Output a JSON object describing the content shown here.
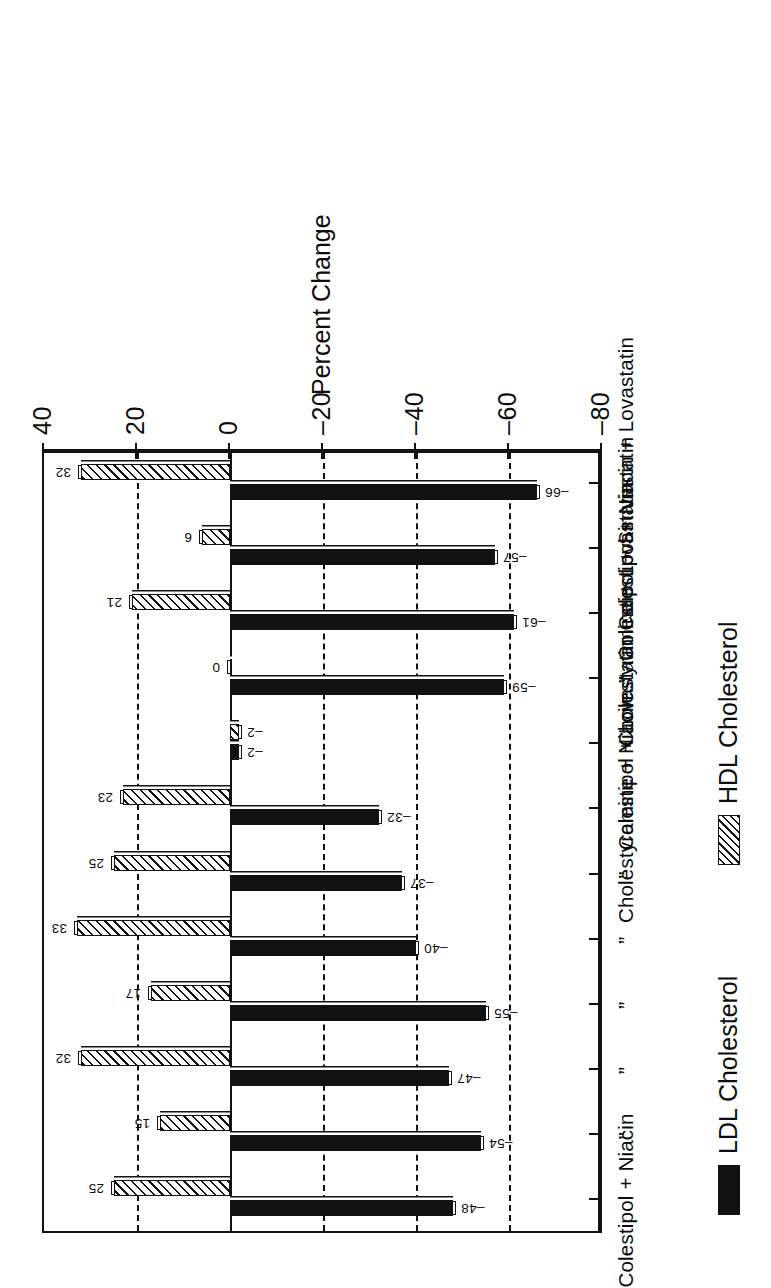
{
  "chart_data": {
    "type": "bar",
    "title": "",
    "orientation": "vertical-bars-on-rotated-page",
    "xlabel": "",
    "ylabel": "Percent Change",
    "ylim": [
      -80,
      40
    ],
    "ytick_values": [
      -80,
      -60,
      -40,
      -20,
      0,
      20,
      40
    ],
    "ytick_labels": [
      "–80",
      "–60",
      "–40",
      "–20",
      "0",
      "20",
      "40"
    ],
    "gridlines": {
      "enabled": true,
      "style": "dashed",
      "at": [
        20,
        -20,
        -40,
        -60
      ]
    },
    "zero_line": true,
    "legend_position": "below-plot",
    "categories": [
      "Colestipol + Niacin",
      "”",
      "”",
      "”",
      "”",
      "”",
      "Cholestyramine + Niacin",
      "Colestipol + Lovastatin",
      "”",
      "Cholestyramine + Lovastatin",
      "Colestipol + Simvastatin",
      "Colestipol + Niacin + Lovastatin"
    ],
    "series": [
      {
        "name": "LDL Cholesterol",
        "fill": "solid-black",
        "color": "#111111",
        "values": [
          -48,
          -54,
          -47,
          -55,
          -40,
          -37,
          -32,
          -2,
          -59,
          -61,
          -57,
          -66
        ],
        "labels": [
          "–48",
          "–54",
          "–47",
          "–55",
          "–40",
          "–37",
          "–32",
          "–2",
          "–59",
          "–61",
          "–57",
          "–66"
        ]
      },
      {
        "name": "HDL Cholesterol",
        "fill": "diagonal-hatch",
        "color": "#111111",
        "values": [
          25,
          15,
          32,
          17,
          33,
          25,
          23,
          -2,
          0,
          21,
          6,
          32
        ],
        "labels": [
          "25",
          "15",
          "32",
          "17",
          "33",
          "25",
          "23",
          "–2",
          "0",
          "21",
          "6",
          "32"
        ]
      }
    ]
  },
  "legend": {
    "items": [
      {
        "label": "LDL Cholesterol",
        "swatch": "solid-black-swatch"
      },
      {
        "label": "HDL Cholesterol",
        "swatch": "hatched-swatch"
      }
    ]
  },
  "axis": {
    "value_axis_title": "Percent Change"
  }
}
